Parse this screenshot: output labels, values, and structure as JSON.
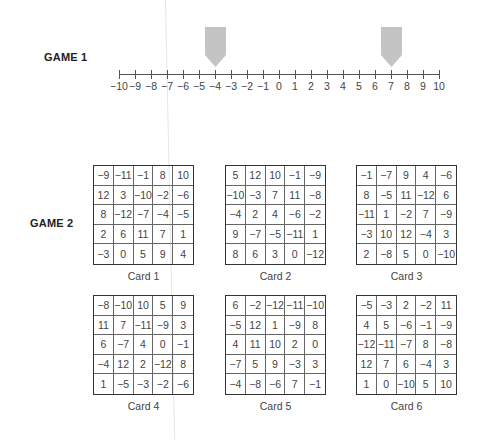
{
  "game1": {
    "label": "GAME 1",
    "number_line": {
      "min": -10,
      "max": 10,
      "ticks": [
        "−10",
        "−9",
        "−8",
        "−7",
        "−6",
        "−5",
        "−4",
        "−3",
        "−2",
        "−1",
        "0",
        "1",
        "2",
        "3",
        "4",
        "5",
        "6",
        "7",
        "8",
        "9",
        "10"
      ]
    },
    "markers": [
      {
        "value": -4,
        "icon": "pentagon-arrow-down-icon",
        "color": "#c4c4c4"
      },
      {
        "value": 7,
        "icon": "pentagon-arrow-down-icon",
        "color": "#c4c4c4"
      }
    ]
  },
  "game2": {
    "label": "GAME 2",
    "cards": [
      {
        "label": "Card 1",
        "rows": [
          [
            "−9",
            "−11",
            "−1",
            "8",
            "10"
          ],
          [
            "12",
            "3",
            "−10",
            "−2",
            "−6"
          ],
          [
            "8",
            "−12",
            "−7",
            "−4",
            "−5"
          ],
          [
            "2",
            "6",
            "11",
            "7",
            "1"
          ],
          [
            "−3",
            "0",
            "5",
            "9",
            "4"
          ]
        ]
      },
      {
        "label": "Card 2",
        "rows": [
          [
            "5",
            "12",
            "10",
            "−1",
            "−9"
          ],
          [
            "−10",
            "−3",
            "7",
            "11",
            "−8"
          ],
          [
            "−4",
            "2",
            "4",
            "−6",
            "−2"
          ],
          [
            "9",
            "−7",
            "−5",
            "−11",
            "1"
          ],
          [
            "8",
            "6",
            "3",
            "0",
            "−12"
          ]
        ]
      },
      {
        "label": "Card 3",
        "rows": [
          [
            "−1",
            "−7",
            "9",
            "4",
            "−6"
          ],
          [
            "8",
            "−5",
            "11",
            "−12",
            "6"
          ],
          [
            "−11",
            "1",
            "−2",
            "7",
            "−9"
          ],
          [
            "−3",
            "10",
            "12",
            "−4",
            "3"
          ],
          [
            "2",
            "−8",
            "5",
            "0",
            "−10"
          ]
        ]
      },
      {
        "label": "Card 4",
        "rows": [
          [
            "−8",
            "−10",
            "10",
            "5",
            "9"
          ],
          [
            "11",
            "7",
            "−11",
            "−9",
            "3"
          ],
          [
            "6",
            "−7",
            "4",
            "0",
            "−1"
          ],
          [
            "−4",
            "12",
            "2",
            "−12",
            "8"
          ],
          [
            "1",
            "−5",
            "−3",
            "−2",
            "−6"
          ]
        ]
      },
      {
        "label": "Card 5",
        "rows": [
          [
            "6",
            "−2",
            "−12",
            "−11",
            "−10"
          ],
          [
            "−5",
            "12",
            "1",
            "−9",
            "8"
          ],
          [
            "4",
            "11",
            "10",
            "2",
            "0"
          ],
          [
            "−7",
            "5",
            "9",
            "−3",
            "3"
          ],
          [
            "−4",
            "−8",
            "−6",
            "7",
            "−1"
          ]
        ]
      },
      {
        "label": "Card 6",
        "rows": [
          [
            "−5",
            "−3",
            "2",
            "−2",
            "11"
          ],
          [
            "4",
            "5",
            "−6",
            "−1",
            "−9"
          ],
          [
            "−12",
            "−11",
            "−7",
            "8",
            "−8"
          ],
          [
            "12",
            "7",
            "6",
            "−4",
            "3"
          ],
          [
            "1",
            "0",
            "−10",
            "5",
            "10"
          ]
        ]
      }
    ]
  }
}
